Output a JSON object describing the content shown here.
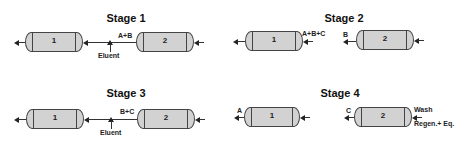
{
  "stages": [
    {
      "title": "Stage 1",
      "col1": "1",
      "col2": "2",
      "between_label": "A+B",
      "inlet_label": "Eluent"
    },
    {
      "title": "Stage 2",
      "col1": "1",
      "col2": "2",
      "col1_inlet_label": "A+B+C",
      "col2_outlet_label": "B"
    },
    {
      "title": "Stage 3",
      "col1": "1",
      "col2": "2",
      "between_label": "B+C",
      "inlet_label": "Eluent"
    },
    {
      "title": "Stage 4",
      "col1": "1",
      "col2": "2",
      "col1_outlet_label": "A",
      "col2_outlet_label": "C",
      "col2_inlet_label_top": "Wash",
      "col2_inlet_label_bottom": "Regen.+ Eq."
    }
  ],
  "colors": {
    "column_fill": "#d2d2d2",
    "stroke": "#444444"
  }
}
